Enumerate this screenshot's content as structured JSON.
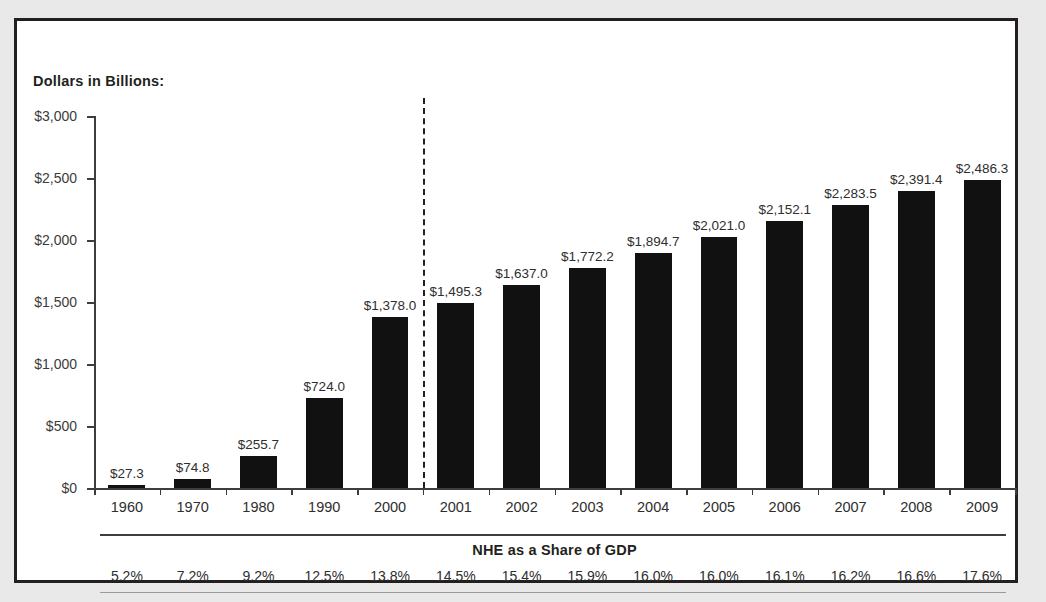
{
  "figure": {
    "y_axis_title": "Dollars in Billions:",
    "gdp_section_heading": "NHE as a Share of GDP",
    "bar_color": "#111111",
    "frame_color": "#231f20",
    "axis_color": "#3d3d3d"
  },
  "chart_data": {
    "type": "bar",
    "title": "Dollars in Billions:",
    "xlabel": "",
    "ylabel": "Dollars in Billions:",
    "ylim": [
      0,
      3000
    ],
    "ytick_labels": [
      "$3,000",
      "$2,500",
      "$2,000",
      "$1,500",
      "$1,000",
      "$500",
      "$0"
    ],
    "ytick_values": [
      3000,
      2500,
      2000,
      1500,
      1000,
      500,
      0
    ],
    "grid": false,
    "legend": "none",
    "categories": [
      "1960",
      "1970",
      "1980",
      "1990",
      "2000",
      "2001",
      "2002",
      "2003",
      "2004",
      "2005",
      "2006",
      "2007",
      "2008",
      "2009"
    ],
    "values": [
      27.3,
      74.8,
      255.7,
      724.0,
      1378.0,
      1495.3,
      1637.0,
      1772.2,
      1894.7,
      2021.0,
      2152.1,
      2283.5,
      2391.4,
      2486.3
    ],
    "data_labels": [
      "$27.3",
      "$74.8",
      "$255.7",
      "$724.0",
      "$1,378.0",
      "$1,495.3",
      "$1,637.0",
      "$1,772.2",
      "$1,894.7",
      "$2,021.0",
      "$2,152.1",
      "$2,283.5",
      "$2,391.4",
      "$2,486.3"
    ],
    "annotations": [
      {
        "type": "vertical-dashed-line",
        "between": [
          "2000",
          "2001"
        ],
        "label": "projection-divider"
      }
    ],
    "secondary_table": {
      "heading": "NHE as a Share of GDP",
      "values": [
        "5.2%",
        "7.2%",
        "9.2%",
        "12.5%",
        "13.8%",
        "14.5%",
        "15.4%",
        "15.9%",
        "16.0%",
        "16.0%",
        "16.1%",
        "16.2%",
        "16.6%",
        "17.6%"
      ],
      "numeric": [
        5.2,
        7.2,
        9.2,
        12.5,
        13.8,
        14.5,
        15.4,
        15.9,
        16.0,
        16.0,
        16.1,
        16.2,
        16.6,
        17.6
      ]
    }
  }
}
